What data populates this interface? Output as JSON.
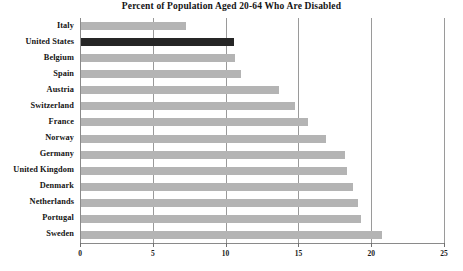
{
  "chart_data": {
    "type": "bar",
    "orientation": "horizontal",
    "title": "Percent of Population Aged 20-64 Who Are Disabled",
    "xlabel": "",
    "ylabel": "",
    "xlim": [
      0,
      25
    ],
    "xticks": [
      0,
      5,
      10,
      15,
      20,
      25
    ],
    "grid": "vertical",
    "legend": "none",
    "categories": [
      "Italy",
      "United States",
      "Belgium",
      "Spain",
      "Austria",
      "Switzerland",
      "France",
      "Norway",
      "Germany",
      "United Kingdom",
      "Denmark",
      "Netherlands",
      "Portugal",
      "Sweden"
    ],
    "values": [
      7.2,
      10.5,
      10.6,
      11.0,
      13.6,
      14.7,
      15.6,
      16.8,
      18.1,
      18.3,
      18.7,
      19.0,
      19.2,
      20.7
    ],
    "highlight_category": "United States",
    "colors": {
      "bar": "#b4b4b4",
      "bar_highlight": "#262626",
      "axis": "#8a8a8a",
      "grid": "#9a9a9a",
      "text": "#141414",
      "background": "#ffffff"
    }
  }
}
